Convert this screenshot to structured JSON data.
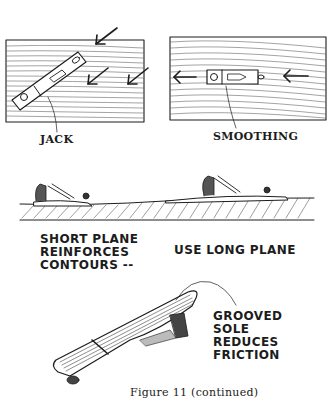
{
  "figure": {
    "caption": "Figure 11  (continued)",
    "colors": {
      "ink": "#1c1c1c",
      "paper": "#ffffff"
    }
  },
  "panels": {
    "jack": {
      "label": "JACK",
      "arrows": 3,
      "arrow_direction": "down-left (diagonal, across grain)"
    },
    "smoothing": {
      "label": "SMOOTHING",
      "arrows": 2,
      "arrow_direction": "left (with grain)"
    },
    "profile": {
      "short_plane_text": "SHORT PLANE\nREINFORCES\nCONTOURS --",
      "long_plane_text": "USE LONG PLANE"
    },
    "sole": {
      "text": "GROOVED\nSOLE\nREDUCES\nFRICTION"
    }
  }
}
